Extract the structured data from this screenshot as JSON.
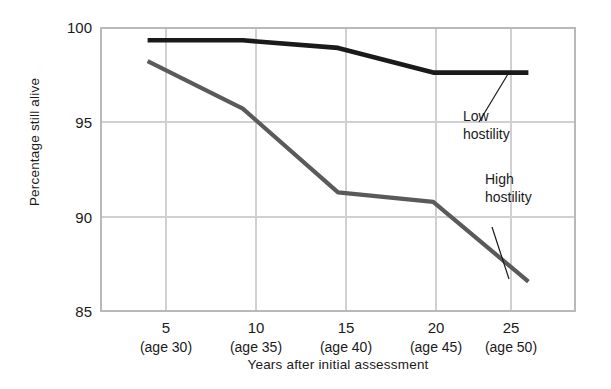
{
  "chart_data": {
    "type": "line",
    "title": "",
    "xlabel": "Years after initial assessment",
    "ylabel": "Percentage still alive",
    "x": [
      5,
      10,
      15,
      20,
      25
    ],
    "categories": [
      "5\n(age 30)",
      "10\n(age 35)",
      "15\n(age 40)",
      "20\n(age 45)",
      "25\n(age 50)"
    ],
    "xtick_labels": [
      "5",
      "10",
      "15",
      "20",
      "25"
    ],
    "xtick_sublabels": [
      "(age 30)",
      "(age 35)",
      "(age 40)",
      "(age 45)",
      "(age 50)"
    ],
    "ytick_labels": [
      "85",
      "90",
      "95",
      "100"
    ],
    "yticks": [
      85,
      90,
      95,
      100
    ],
    "xlim": [
      2.5,
      27.5
    ],
    "ylim": [
      85,
      100
    ],
    "grid": true,
    "legend_position": "inline-annotations",
    "series": [
      {
        "name": "Low hostility",
        "color": "#1a1a1a",
        "values": [
          99.3,
          99.3,
          98.9,
          97.6,
          97.6
        ]
      },
      {
        "name": "High hostility",
        "color": "#5a5a5a",
        "values": [
          98.2,
          95.7,
          91.3,
          90.8,
          86.6
        ]
      }
    ],
    "annotations": [
      {
        "text_line1": "Low",
        "text_line2": "hostility",
        "points_to_series": "Low hostility",
        "points_to_x": 25
      },
      {
        "text_line1": "High",
        "text_line2": "hostility",
        "points_to_series": "High hostility",
        "points_to_x": 25
      }
    ]
  },
  "axes": {
    "y_title": "Percentage still alive",
    "x_title": "Years after initial assessment",
    "y_ticks": [
      {
        "label": "100"
      },
      {
        "label": "95"
      },
      {
        "label": "90"
      },
      {
        "label": "85"
      }
    ],
    "x_ticks": [
      {
        "label": "5",
        "sublabel": "(age 30)"
      },
      {
        "label": "10",
        "sublabel": "(age 35)"
      },
      {
        "label": "15",
        "sublabel": "(age 40)"
      },
      {
        "label": "20",
        "sublabel": "(age 45)"
      },
      {
        "label": "25",
        "sublabel": "(age 50)"
      }
    ]
  },
  "annotations": {
    "low": {
      "line1": "Low",
      "line2": "hostility"
    },
    "high": {
      "line1": "High",
      "line2": "hostility"
    }
  },
  "colors": {
    "low_hostility_line": "#1a1a1a",
    "high_hostility_line": "#5a5a5a",
    "grid": "#d0d0d0",
    "frame": "#b9b9b9",
    "background": "#ffffff",
    "text": "#1a1a1a"
  }
}
